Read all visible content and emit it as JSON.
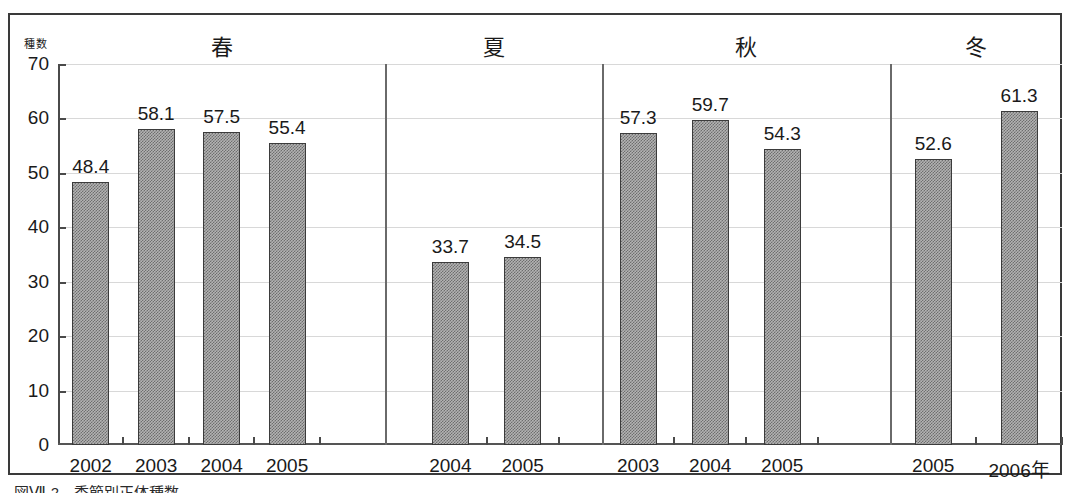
{
  "figure": {
    "y_axis_title": "種数",
    "caption": "図Ⅶ-2　季節別正体種数"
  },
  "chart_data": {
    "type": "bar",
    "title": "",
    "subtitle": "",
    "xlabel": "",
    "ylabel": "種数",
    "ylim": [
      0,
      70
    ],
    "ytick_step": 10,
    "yticks": [
      "70",
      "60",
      "50",
      "40",
      "30",
      "20",
      "10",
      "0"
    ],
    "grid": true,
    "legend": null,
    "bar_fill": "#b3b3b3",
    "bar_pattern": "checkerboard-dither",
    "bar_border": "#3b3b3b",
    "groups": [
      {
        "name": "春",
        "categories": [
          "2002",
          "2003",
          "2004",
          "2005"
        ],
        "values": [
          48.4,
          58.1,
          57.5,
          55.4
        ],
        "labels": [
          "48.4",
          "58.1",
          "57.5",
          "55.4"
        ]
      },
      {
        "name": "夏",
        "categories": [
          "2004",
          "2005"
        ],
        "values": [
          33.7,
          34.5
        ],
        "labels": [
          "33.7",
          "34.5"
        ]
      },
      {
        "name": "秋",
        "categories": [
          "2003",
          "2004",
          "2005"
        ],
        "values": [
          57.3,
          59.7,
          54.3
        ],
        "labels": [
          "57.3",
          "59.7",
          "54.3"
        ]
      },
      {
        "name": "冬",
        "categories": [
          "2005",
          "2006年"
        ],
        "values": [
          52.6,
          61.3
        ],
        "labels": [
          "52.6",
          "61.3"
        ]
      }
    ]
  }
}
